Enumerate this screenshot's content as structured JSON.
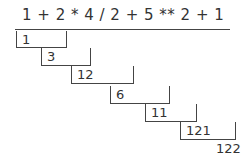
{
  "expression": "1 + 2 * 4 / 2 + 5 ** 2 + 1",
  "steps": [
    {
      "value": "1"
    },
    {
      "value": "3"
    },
    {
      "value": "12"
    },
    {
      "value": "6"
    },
    {
      "value": "11"
    },
    {
      "value": "121"
    }
  ],
  "result": "122"
}
